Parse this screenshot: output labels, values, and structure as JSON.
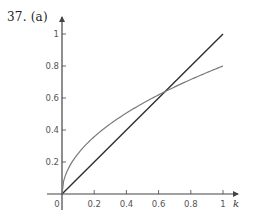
{
  "figure": {
    "label": "37. (a)"
  },
  "chart_data": {
    "type": "line",
    "title": "37. (a)",
    "xlabel": "k",
    "ylabel": "",
    "xlim": [
      0,
      1.05
    ],
    "ylim": [
      0,
      1.05
    ],
    "x_ticks": [
      0,
      0.2,
      0.4,
      0.6,
      0.8,
      1
    ],
    "x_tick_labels": [
      "0",
      "0.2",
      "0.4",
      "0.6",
      "0.8",
      "1"
    ],
    "y_ticks": [
      0.2,
      0.4,
      0.6,
      0.8,
      1
    ],
    "y_tick_labels": [
      "0.2",
      "0.4",
      "0.6",
      "0.8",
      "1"
    ],
    "grid": false,
    "legend": null,
    "series": [
      {
        "name": "line y = k",
        "color": "#2e2e2e",
        "x": [
          0,
          1
        ],
        "y": [
          0,
          1
        ]
      },
      {
        "name": "curve y = 0.8·sqrt(k)",
        "color": "#7a7a7a",
        "x": [
          0,
          0.01,
          0.05,
          0.1,
          0.2,
          0.3,
          0.4,
          0.5,
          0.64,
          0.7,
          0.8,
          0.9,
          1
        ],
        "y": [
          0,
          0.08,
          0.179,
          0.253,
          0.358,
          0.438,
          0.506,
          0.566,
          0.64,
          0.669,
          0.716,
          0.759,
          0.8
        ]
      }
    ],
    "annotations": [
      {
        "text": "intersection",
        "x": 0.64,
        "y": 0.64
      }
    ]
  },
  "colors": {
    "axis": "#444444",
    "line": "#2e2e2e",
    "curve": "#7a7a7a"
  }
}
